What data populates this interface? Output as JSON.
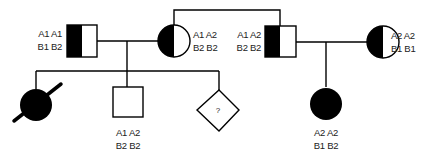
{
  "diagram": {
    "type": "pedigree",
    "colors": {
      "line": "#000000",
      "fill": "#000000",
      "background": "#ffffff"
    },
    "individuals": [
      {
        "id": "gen1-male-left",
        "sex": "male",
        "affected": "half",
        "genotype": {
          "line1": "A1 A1",
          "line2": "B1 B2"
        }
      },
      {
        "id": "gen1-female-left",
        "sex": "female",
        "affected": "half",
        "genotype": {
          "line1": "A1 A2",
          "line2": "B2 B2"
        }
      },
      {
        "id": "gen1-male-right",
        "sex": "male",
        "affected": "half",
        "genotype": {
          "line1": "A1 A2",
          "line2": "B2 B2"
        }
      },
      {
        "id": "gen1-female-right",
        "sex": "female",
        "affected": "half",
        "genotype": {
          "line1": "A2 A2",
          "line2": "B1 B1"
        }
      },
      {
        "id": "gen2-female-deceased",
        "sex": "female",
        "affected": "full",
        "deceased": true
      },
      {
        "id": "gen2-male",
        "sex": "male",
        "affected": "none",
        "genotype": {
          "line1": "A1 A2",
          "line2": "B2 B2"
        }
      },
      {
        "id": "gen2-unknown",
        "sex": "unknown",
        "affected": "none",
        "label": "?"
      },
      {
        "id": "gen2-female-right",
        "sex": "female",
        "affected": "full",
        "genotype": {
          "line1": "A2 A2",
          "line2": "B1 B2"
        }
      }
    ]
  }
}
